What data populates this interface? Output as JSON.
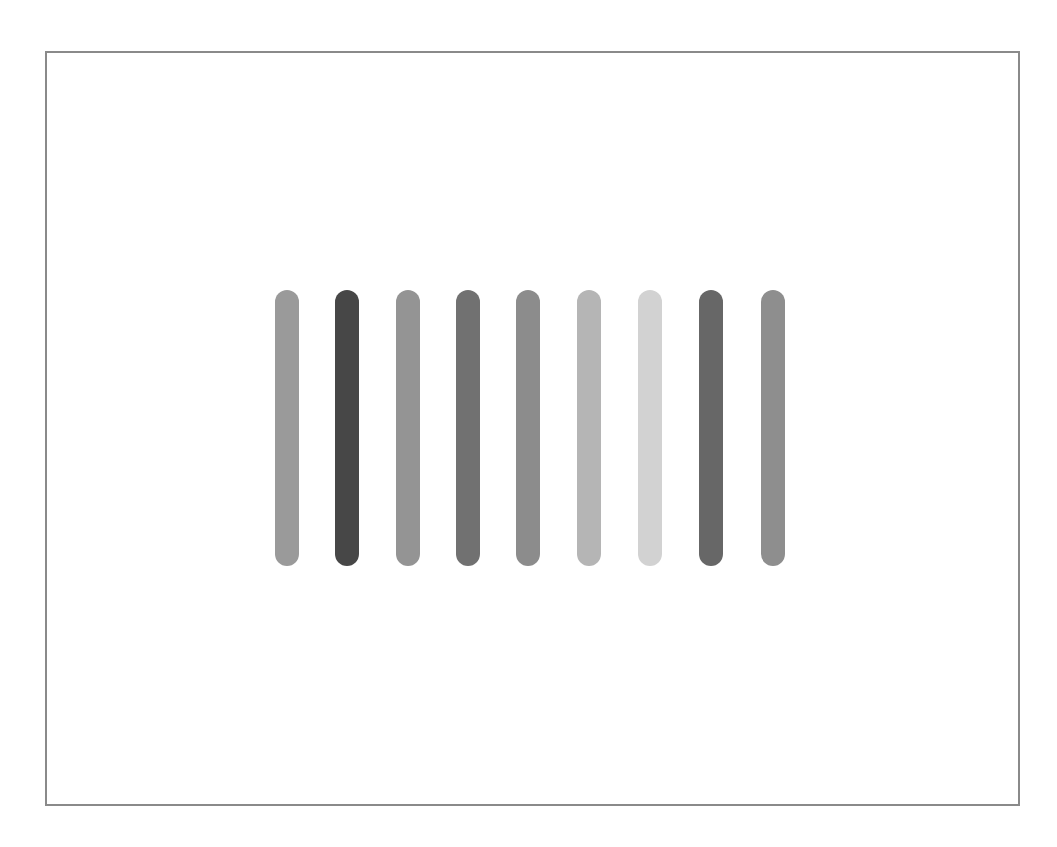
{
  "canvas": {
    "border_color": "#8a8a8a",
    "background": "#ffffff"
  },
  "bars": [
    {
      "name": "bar-1",
      "x": 275,
      "top": 290,
      "bottom": 566,
      "color": "#9a9a9a"
    },
    {
      "name": "bar-2",
      "x": 335,
      "top": 290,
      "bottom": 566,
      "color": "#474747"
    },
    {
      "name": "bar-3",
      "x": 396,
      "top": 290,
      "bottom": 566,
      "color": "#949494"
    },
    {
      "name": "bar-4",
      "x": 456,
      "top": 290,
      "bottom": 566,
      "color": "#717171"
    },
    {
      "name": "bar-5",
      "x": 516,
      "top": 290,
      "bottom": 566,
      "color": "#8c8c8c"
    },
    {
      "name": "bar-6",
      "x": 577,
      "top": 290,
      "bottom": 566,
      "color": "#b5b5b5"
    },
    {
      "name": "bar-7",
      "x": 638,
      "top": 290,
      "bottom": 566,
      "color": "#d2d2d2"
    },
    {
      "name": "bar-8",
      "x": 699,
      "top": 290,
      "bottom": 566,
      "color": "#676767"
    },
    {
      "name": "bar-9",
      "x": 761,
      "top": 290,
      "bottom": 566,
      "color": "#8e8e8e"
    }
  ]
}
